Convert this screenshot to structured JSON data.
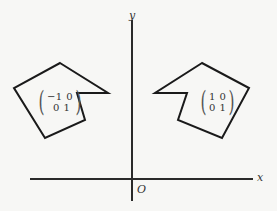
{
  "diagram": {
    "axes": {
      "x_label": "x",
      "y_label": "y",
      "origin_label": "O"
    },
    "left_shape": {
      "matrix_row1": "−1 0",
      "matrix_row2": "0 1",
      "points": "60,63 108,93 77,93 85,120 45,138 14,88"
    },
    "right_shape": {
      "matrix_row1": "1 0",
      "matrix_row2": "0 1",
      "points": "202,63 155,93 187,93 178,120 222,138 249,88"
    },
    "colors": {
      "stroke": "#1a1a1a",
      "background": "#f7f7f5"
    }
  }
}
